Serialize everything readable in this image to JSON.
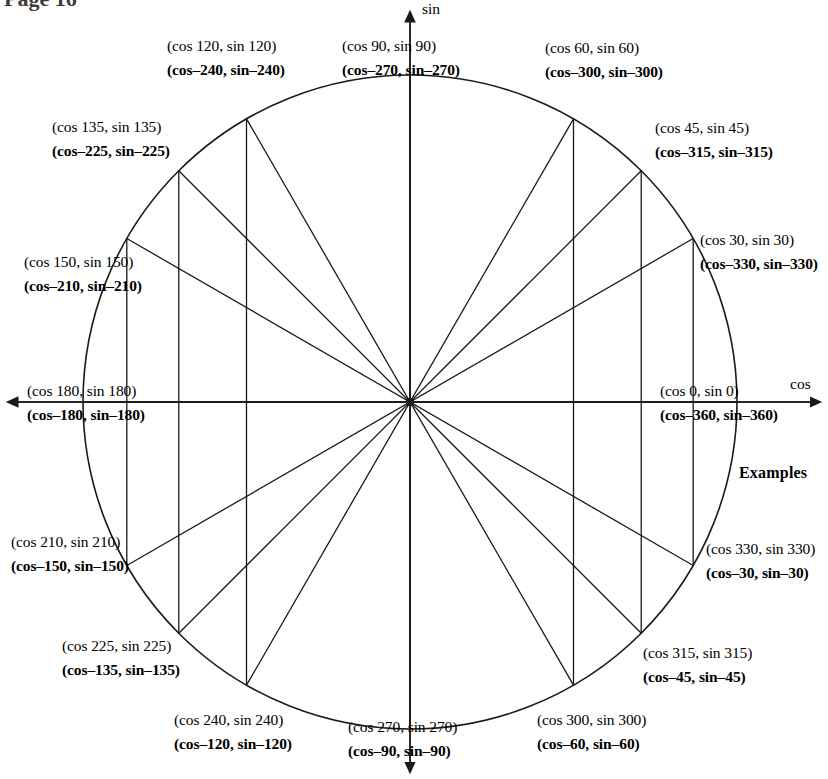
{
  "page": {
    "header_fragment": "Page 16",
    "examples_label": "Examples"
  },
  "axes": {
    "x_label": "cos",
    "y_label": "sin"
  },
  "geometry": {
    "center_x": 410,
    "center_y": 402,
    "radius": 327,
    "stroke_color": "#1a1a1a",
    "background": "#ffffff"
  },
  "chart_data": {
    "type": "scatter",
    "xlabel": "cos",
    "ylabel": "sin",
    "grid": false,
    "legend": "none",
    "xlim": [
      -1,
      1
    ],
    "ylim": [
      -1,
      1
    ],
    "angles_deg": [
      0,
      30,
      45,
      60,
      90,
      120,
      135,
      150,
      180,
      210,
      225,
      240,
      270,
      300,
      315,
      330
    ],
    "negative_coterminal_deg": [
      -360,
      -330,
      -315,
      -300,
      -270,
      -240,
      -225,
      -210,
      -180,
      -150,
      -135,
      -120,
      -90,
      -60,
      -45,
      -30
    ],
    "diameter_lines_deg": [
      0,
      30,
      45,
      60,
      90,
      120,
      135,
      150
    ],
    "vertical_chords_at_cos_of_deg": [
      30,
      45,
      60,
      120,
      135,
      150
    ]
  },
  "points": [
    {
      "angle": 0,
      "primary": "(cos 0,  sin 0)",
      "secondary": "(cos–360,  sin–360)",
      "px": 737,
      "py": 402,
      "label_left": 660,
      "label_top": 383,
      "align": "left"
    },
    {
      "angle": 30,
      "primary": "(cos 30,  sin 30)",
      "secondary": "(cos–330,  sin–330)",
      "px": 693,
      "py": 239,
      "label_left": 700,
      "label_top": 232,
      "align": "left"
    },
    {
      "angle": 45,
      "primary": "(cos 45,  sin 45)",
      "secondary": "(cos–315,  sin–315)",
      "px": 641,
      "py": 171,
      "label_left": 655,
      "label_top": 120,
      "align": "left"
    },
    {
      "angle": 60,
      "primary": "(cos 60,  sin 60)",
      "secondary": "(cos–300,  sin–300)",
      "px": 574,
      "py": 119,
      "label_left": 545,
      "label_top": 40,
      "align": "left"
    },
    {
      "angle": 90,
      "primary": "(cos 90,  sin 90)",
      "secondary": "(cos–270,  sin–270)",
      "px": 410,
      "py": 75,
      "label_left": 342,
      "label_top": 38,
      "align": "left"
    },
    {
      "angle": 120,
      "primary": "(cos 120,  sin 120)",
      "secondary": "(cos–240,  sin–240)",
      "px": 246,
      "py": 119,
      "label_left": 167,
      "label_top": 38,
      "align": "left"
    },
    {
      "angle": 135,
      "primary": "(cos 135,  sin 135)",
      "secondary": "(cos–225,  sin–225)",
      "px": 179,
      "py": 171,
      "label_left": 52,
      "label_top": 119,
      "align": "left"
    },
    {
      "angle": 150,
      "primary": "(cos 150,  sin 150)",
      "secondary": "(cos–210,  sin–210)",
      "px": 127,
      "py": 239,
      "label_left": 24,
      "label_top": 254,
      "align": "left"
    },
    {
      "angle": 180,
      "primary": "(cos 180,  sin 180)",
      "secondary": "(cos–180,  sin–180)",
      "px": 83,
      "py": 402,
      "label_left": 27,
      "label_top": 383,
      "align": "left"
    },
    {
      "angle": 210,
      "primary": "(cos 210,  sin 210)",
      "secondary": "(cos–150,  sin–150)",
      "px": 127,
      "py": 565,
      "label_left": 11,
      "label_top": 534,
      "align": "left"
    },
    {
      "angle": 225,
      "primary": "(cos 225,  sin 225)",
      "secondary": "(cos–135,  sin–135)",
      "px": 179,
      "py": 633,
      "label_left": 62,
      "label_top": 638,
      "align": "left"
    },
    {
      "angle": 240,
      "primary": "(cos 240,  sin 240)",
      "secondary": "(cos–120,  sin–120)",
      "px": 246,
      "py": 685,
      "label_left": 174,
      "label_top": 712,
      "align": "left"
    },
    {
      "angle": 270,
      "primary": "(cos 270,  sin 270)",
      "secondary": "(cos–90,  sin–90)",
      "px": 410,
      "py": 729,
      "label_left": 348,
      "label_top": 719,
      "align": "left"
    },
    {
      "angle": 300,
      "primary": "(cos 300,  sin 300)",
      "secondary": "(cos–60,  sin–60)",
      "px": 574,
      "py": 685,
      "label_left": 537,
      "label_top": 712,
      "align": "left"
    },
    {
      "angle": 315,
      "primary": "(cos 315,  sin 315)",
      "secondary": "(cos–45,  sin–45)",
      "px": 641,
      "py": 633,
      "label_left": 643,
      "label_top": 645,
      "align": "left"
    },
    {
      "angle": 330,
      "primary": "(cos 330,  sin 330)",
      "secondary": "(cos–30,  sin–30)",
      "px": 693,
      "py": 565,
      "label_left": 706,
      "label_top": 541,
      "align": "left"
    }
  ]
}
